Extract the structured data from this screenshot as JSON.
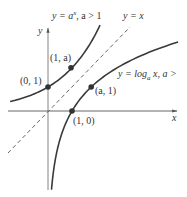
{
  "figure": {
    "axes": {
      "x_label": "x",
      "y_label": "y"
    },
    "curves": [
      {
        "id": "exponential",
        "label": "y = a^x, a > 1",
        "label_parts": {
          "pre": "y = a",
          "sup": "x",
          "post": ", a > 1"
        }
      },
      {
        "id": "identity",
        "label": "y = x",
        "style": "dashed"
      },
      {
        "id": "logarithm",
        "label": "y = log_a x, a >",
        "label_parts": {
          "pre": "y = log",
          "sub": "a",
          "post": " x, a >"
        }
      }
    ],
    "points": [
      {
        "label": "(0, 1)"
      },
      {
        "label": "(1, a)"
      },
      {
        "label": "(a, 1)"
      },
      {
        "label": "(1, 0)"
      }
    ],
    "colors": {
      "curve": "#3a3a3a",
      "axis": "#555555",
      "dashed": "#555555",
      "text": "#333333"
    }
  }
}
